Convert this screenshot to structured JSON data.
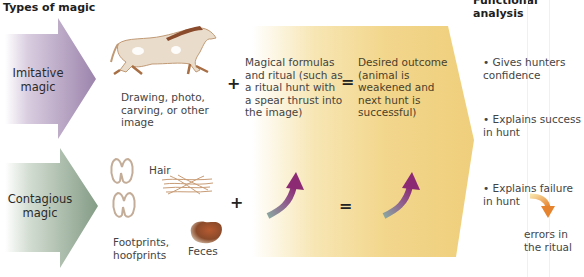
{
  "headers": {
    "left": "Types of magic",
    "right": "Functional analysis"
  },
  "types": [
    {
      "label_line1": "Imitative",
      "label_line2": "magic",
      "color_top": "#a58db3",
      "color_fade": "#ffffff"
    },
    {
      "label_line1": "Contagious",
      "label_line2": "magic",
      "color_top": "#8ea48f",
      "color_fade": "#ffffff"
    }
  ],
  "imitative": {
    "image_icon": "horse-cave-painting-icon",
    "image_caption": [
      "Drawing, photo,",
      "carving, or other",
      "image"
    ],
    "plus": "+",
    "ritual_text": [
      "Magical formulas",
      "and ritual (such as",
      "a ritual hunt with",
      "a spear thrust into",
      "the image)"
    ],
    "equals": "=",
    "outcome_text": [
      "Desired outcome",
      "(animal is",
      "weakened and",
      "next hunt is",
      "successful)"
    ]
  },
  "contagious": {
    "items": [
      {
        "icon": "hoofprint-icon",
        "caption": ""
      },
      {
        "icon": "hair-icon",
        "caption": "Hair"
      },
      {
        "icon": "feces-icon",
        "caption": "Feces"
      }
    ],
    "footprints_caption": [
      "Footprints,",
      "hoofprints"
    ],
    "hair_caption": "Hair",
    "feces_caption": "Feces",
    "plus": "+",
    "equals": "="
  },
  "functional_analysis": {
    "bullets": [
      [
        "Gives hunters",
        "confidence"
      ],
      [
        "Explains success",
        "in hunt"
      ],
      [
        "Explains failure",
        "in hunt"
      ]
    ],
    "failure_result": [
      "errors in",
      "the ritual"
    ]
  },
  "colors": {
    "outcome_yellow": "#f2d58a",
    "curved_arrow_start": "#8aa3a0",
    "curved_arrow_end": "#8e2f78",
    "result_arrow": "#e98f3a",
    "image_brown": "#b88b5e"
  }
}
